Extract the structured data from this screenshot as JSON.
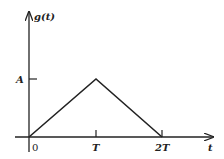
{
  "diagram": {
    "type": "triangular-pulse",
    "y_axis_label": "g(t)",
    "x_axis_label": "t",
    "amplitude_label": "A",
    "x_ticks": [
      "0",
      "T",
      "2T"
    ],
    "points": [
      {
        "t": "0",
        "value": "0"
      },
      {
        "t": "T",
        "value": "A"
      },
      {
        "t": "2T",
        "value": "0"
      }
    ],
    "line_color": "#222222"
  }
}
